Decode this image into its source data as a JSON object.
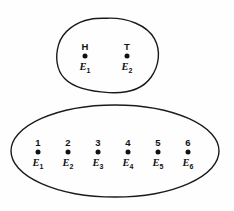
{
  "figure": {
    "background_color": "#fefefe",
    "stroke_color": "#1a1a1a",
    "point_color": "#111111",
    "type": "venn-style-sample-space-diagram",
    "sets": [
      {
        "name": "coin-toss-sample-space",
        "shape": "rounded-blob",
        "center_x": 107,
        "center_y": 55,
        "radius_x": 50,
        "radius_y": 37,
        "points": [
          {
            "id": "point-h",
            "top_label": "H",
            "event_label": "E",
            "event_subscript": "1",
            "x": 85,
            "y": 56
          },
          {
            "id": "point-t",
            "top_label": "T",
            "event_label": "E",
            "event_subscript": "2",
            "x": 127,
            "y": 56
          }
        ]
      },
      {
        "name": "die-roll-sample-space",
        "shape": "ellipse",
        "center_x": 115,
        "center_y": 151,
        "radius_x": 104,
        "radius_y": 46,
        "points": [
          {
            "id": "point-1",
            "top_label": "1",
            "event_label": "E",
            "event_subscript": "1",
            "x": 38,
            "y": 152
          },
          {
            "id": "point-2",
            "top_label": "2",
            "event_label": "E",
            "event_subscript": "2",
            "x": 68,
            "y": 152
          },
          {
            "id": "point-3",
            "top_label": "3",
            "event_label": "E",
            "event_subscript": "3",
            "x": 98,
            "y": 152
          },
          {
            "id": "point-4",
            "top_label": "4",
            "event_label": "E",
            "event_subscript": "4",
            "x": 128,
            "y": 152
          },
          {
            "id": "point-5",
            "top_label": "5",
            "event_label": "E",
            "event_subscript": "5",
            "x": 158,
            "y": 152
          },
          {
            "id": "point-6",
            "top_label": "6",
            "event_label": "E",
            "event_subscript": "6",
            "x": 188,
            "y": 152
          }
        ]
      }
    ]
  }
}
